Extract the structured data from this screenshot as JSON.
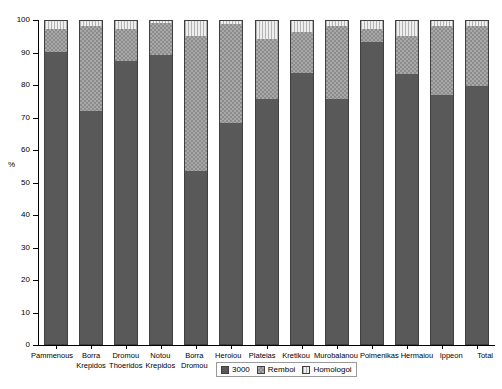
{
  "chart_data": {
    "type": "bar",
    "stacked": true,
    "title": "",
    "subtitle": "",
    "xlabel": "",
    "ylabel": "%",
    "ylim": [
      0,
      100
    ],
    "yticks": [
      0,
      10,
      20,
      30,
      40,
      50,
      60,
      70,
      80,
      90,
      100
    ],
    "grid": false,
    "legend_position": "bottom",
    "categories": [
      "Pammenous",
      "Borra Krepidos",
      "Dromou Thoeridos",
      "Notou Krepidos",
      "Borra Dromou",
      "Heroiou",
      "Plateias",
      "Kretikou",
      "Murobalanou",
      "Poimenikas",
      "Hermaiou",
      "Ippeon",
      "Total"
    ],
    "category_lines": [
      [
        "Pammenous",
        ""
      ],
      [
        "Borra",
        "Krepidos"
      ],
      [
        "Dromou",
        "Thoeridos"
      ],
      [
        "Notou",
        "Krepidos"
      ],
      [
        "Borra",
        "Dromou"
      ],
      [
        "Heroiou",
        ""
      ],
      [
        "Plateias",
        ""
      ],
      [
        "Murobalanou",
        ""
      ],
      [
        "Kretikou",
        ""
      ],
      [
        "Poimenikas",
        ""
      ],
      [
        "Hermaiou",
        ""
      ],
      [
        "Ippeon",
        ""
      ],
      [
        "Total",
        ""
      ]
    ],
    "series": [
      {
        "name": "3000",
        "color": "#595959",
        "values": [
          90.5,
          72.0,
          87.5,
          89.5,
          53.5,
          68.5,
          76.0,
          84.0,
          76.0,
          93.5,
          83.5,
          77.0,
          80.0
        ]
      },
      {
        "name": "Remboi",
        "color": "#a8a8a8",
        "values": [
          7.0,
          26.5,
          10.0,
          9.8,
          42.0,
          30.5,
          18.5,
          12.5,
          22.5,
          4.0,
          12.0,
          21.5,
          18.5
        ]
      },
      {
        "name": "Homologoi",
        "color": "#e2e2e2",
        "values": [
          2.5,
          1.5,
          2.5,
          0.7,
          4.5,
          1.0,
          5.5,
          3.5,
          1.5,
          2.5,
          4.5,
          1.5,
          1.5
        ]
      }
    ]
  },
  "axis": {
    "y_title": "%",
    "y_tick_labels": [
      "100",
      "90",
      "80",
      "70",
      "60",
      "50",
      "40",
      "30",
      "20",
      "10",
      "0"
    ]
  },
  "legend": {
    "items": [
      {
        "label": "3000",
        "swatch": "solid-dark-swatch"
      },
      {
        "label": "Remboi",
        "swatch": "checkered-gray-swatch"
      },
      {
        "label": "Homologoi",
        "swatch": "lined-light-swatch"
      }
    ]
  }
}
